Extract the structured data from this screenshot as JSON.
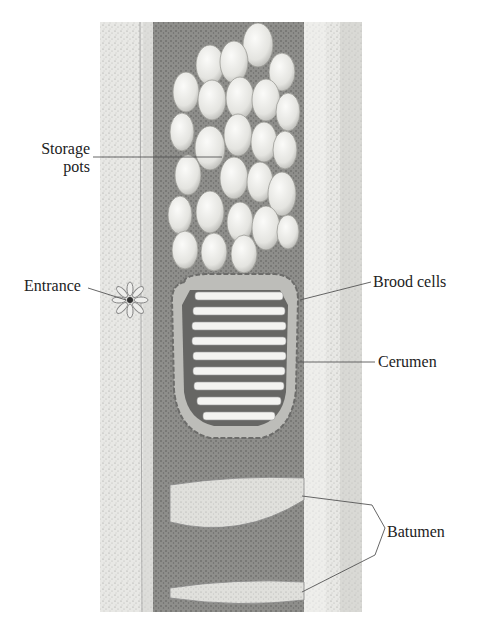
{
  "figure": {
    "labels": {
      "storage_pots_line1": "Storage",
      "storage_pots_line2": "pots",
      "entrance": "Entrance",
      "brood_cells": "Brood cells",
      "cerumen": "Cerumen",
      "batumen": "Batumen"
    },
    "colors": {
      "background": "#ffffff",
      "bark": "#e6e6e4",
      "bark_shade": "#cfcfcc",
      "cavity": "#8d8d8a",
      "pot": "#f1f1ee",
      "pot_edge": "#9a9a96",
      "brood_bar": "#f3f3f1",
      "brood_gap": "#6a6a68",
      "cerumen": "#b9b9b5",
      "batumen": "#dcdcd8",
      "leader": "#555555",
      "text": "#222222"
    }
  }
}
